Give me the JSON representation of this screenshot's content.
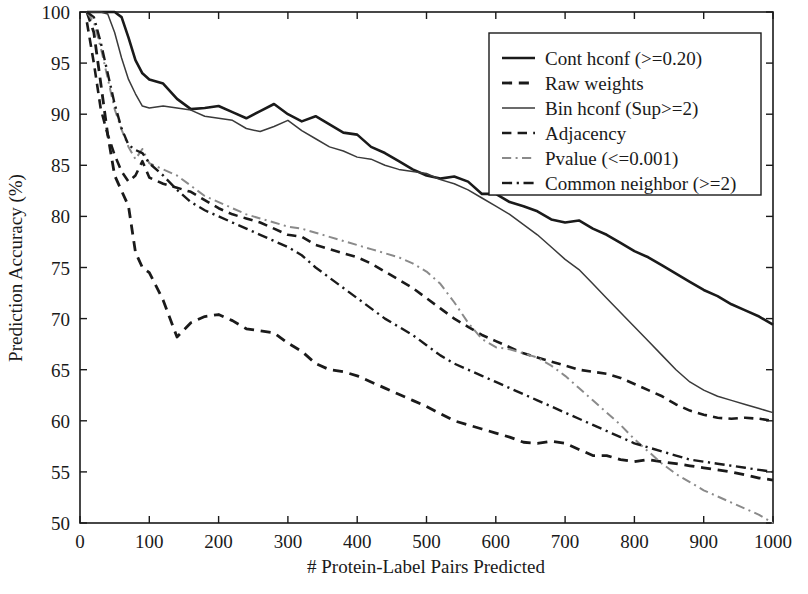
{
  "chart_data": {
    "type": "line",
    "title": "",
    "xlabel": "# Protein-Label Pairs Predicted",
    "ylabel": "Prediction Accuracy (%)",
    "xlim": [
      0,
      1000
    ],
    "ylim": [
      50,
      100
    ],
    "xticks": [
      0,
      100,
      200,
      300,
      400,
      500,
      600,
      700,
      800,
      900,
      1000
    ],
    "yticks": [
      50,
      55,
      60,
      65,
      70,
      75,
      80,
      85,
      90,
      95,
      100
    ],
    "grid": false,
    "legend_position": "top-right",
    "x": [
      10,
      20,
      30,
      40,
      50,
      60,
      70,
      80,
      90,
      100,
      120,
      140,
      160,
      180,
      200,
      220,
      240,
      260,
      280,
      300,
      320,
      340,
      360,
      380,
      400,
      420,
      440,
      460,
      480,
      500,
      520,
      540,
      560,
      580,
      600,
      620,
      640,
      660,
      680,
      700,
      720,
      740,
      760,
      780,
      800,
      820,
      840,
      860,
      880,
      900,
      920,
      940,
      960,
      980,
      1000
    ],
    "series": [
      {
        "name": "Cont hconf (>=0.20)",
        "style": "solid",
        "color": "#1a1a1a",
        "width": 2.6,
        "values": [
          100,
          100,
          100,
          100,
          100,
          99.5,
          97.5,
          95.3,
          94.0,
          93.4,
          93.0,
          91.5,
          90.5,
          90.6,
          90.8,
          90.2,
          89.6,
          90.3,
          91.0,
          90.0,
          89.3,
          89.8,
          89.0,
          88.2,
          88.0,
          86.8,
          86.2,
          85.4,
          84.6,
          84.0,
          83.7,
          83.9,
          83.4,
          82.2,
          82.2,
          81.4,
          81.0,
          80.5,
          79.7,
          79.4,
          79.6,
          78.8,
          78.2,
          77.4,
          76.6,
          76.0,
          75.2,
          74.4,
          73.6,
          72.8,
          72.2,
          71.4,
          70.8,
          70.2,
          69.4
        ]
      },
      {
        "name": "Raw weights",
        "style": "dashed",
        "color": "#1a1a1a",
        "width": 2.8,
        "values": [
          100,
          98.0,
          93.0,
          88.0,
          84.0,
          82.5,
          81.0,
          76.5,
          75.0,
          74.5,
          71.8,
          68.2,
          69.6,
          70.2,
          70.4,
          69.8,
          69.0,
          68.8,
          68.6,
          67.6,
          66.8,
          65.6,
          65.0,
          64.8,
          64.4,
          63.8,
          63.2,
          62.6,
          62.0,
          61.4,
          60.7,
          60.0,
          59.6,
          59.2,
          58.8,
          58.4,
          57.9,
          57.8,
          58.0,
          57.8,
          57.2,
          56.6,
          56.6,
          56.2,
          56.0,
          56.2,
          56.0,
          55.8,
          55.6,
          55.4,
          55.2,
          55.0,
          54.7,
          54.4,
          54.2
        ]
      },
      {
        "name": "Bin hconf (Sup>=2)",
        "style": "solid",
        "color": "#3a3a3a",
        "width": 1.5,
        "values": [
          100,
          100,
          100,
          99.8,
          98.0,
          95.5,
          93.4,
          92.0,
          90.8,
          90.6,
          90.8,
          90.6,
          90.4,
          89.8,
          89.6,
          89.4,
          88.6,
          88.3,
          88.8,
          89.4,
          88.4,
          87.6,
          86.8,
          86.4,
          85.8,
          85.6,
          85.0,
          84.6,
          84.4,
          84.2,
          83.6,
          83.2,
          82.6,
          81.8,
          81.0,
          80.2,
          79.2,
          78.2,
          77.0,
          75.8,
          74.8,
          73.4,
          72.0,
          70.6,
          69.2,
          67.8,
          66.4,
          65.0,
          63.8,
          63.0,
          62.4,
          62.0,
          61.6,
          61.2,
          60.8
        ]
      },
      {
        "name": "Adjacency",
        "style": "dashed",
        "color": "#1a1a1a",
        "width": 2.6,
        "values": [
          99.0,
          95.0,
          90.5,
          88.0,
          86.0,
          84.4,
          83.4,
          84.0,
          85.4,
          83.8,
          83.2,
          82.8,
          82.4,
          81.6,
          80.8,
          80.2,
          79.8,
          79.4,
          78.8,
          78.2,
          78.0,
          77.2,
          76.8,
          76.4,
          76.0,
          75.4,
          74.6,
          73.8,
          73.0,
          72.0,
          71.0,
          70.0,
          69.2,
          68.4,
          67.8,
          67.2,
          66.6,
          66.2,
          65.8,
          65.4,
          65.0,
          64.8,
          64.6,
          64.2,
          63.6,
          63.0,
          62.4,
          61.6,
          61.0,
          60.6,
          60.3,
          60.2,
          60.3,
          60.2,
          60.0
        ]
      },
      {
        "name": "Pvalue (<=0.001)",
        "style": "dashdot-light",
        "color": "#8a8a8a",
        "width": 2.0,
        "values": [
          100,
          99.0,
          96.5,
          93.5,
          90.5,
          88.5,
          86.8,
          85.6,
          86.6,
          85.2,
          84.6,
          84.0,
          83.0,
          82.0,
          81.4,
          80.8,
          80.2,
          79.8,
          79.4,
          79.0,
          78.8,
          78.4,
          78.0,
          77.6,
          77.2,
          76.8,
          76.4,
          76.0,
          75.4,
          74.6,
          73.4,
          71.6,
          69.6,
          68.0,
          67.2,
          67.0,
          66.6,
          66.2,
          65.4,
          64.4,
          63.2,
          62.0,
          60.8,
          59.6,
          58.2,
          57.0,
          55.8,
          54.8,
          54.0,
          53.2,
          52.6,
          52.0,
          51.4,
          50.8,
          50.0
        ]
      },
      {
        "name": "Common neighbor (>=2)",
        "style": "dashdot",
        "color": "#1a1a1a",
        "width": 2.4,
        "values": [
          100,
          99.5,
          97.0,
          94.0,
          91.0,
          88.6,
          87.0,
          86.5,
          86.2,
          85.2,
          84.0,
          82.6,
          81.4,
          80.6,
          80.0,
          79.4,
          78.8,
          78.2,
          77.6,
          77.0,
          76.2,
          75.0,
          74.0,
          73.0,
          72.0,
          71.0,
          70.0,
          69.2,
          68.4,
          67.4,
          66.4,
          65.6,
          65.0,
          64.4,
          63.8,
          63.2,
          62.6,
          62.0,
          61.4,
          60.8,
          60.2,
          59.6,
          59.0,
          58.4,
          57.8,
          57.4,
          57.0,
          56.6,
          56.2,
          56.0,
          55.8,
          55.6,
          55.4,
          55.2,
          55.0
        ]
      }
    ]
  },
  "legend": {
    "entries": [
      {
        "label": "Cont hconf (>=0.20)"
      },
      {
        "label": "Raw weights"
      },
      {
        "label": "Bin hconf (Sup>=2)"
      },
      {
        "label": "Adjacency"
      },
      {
        "label": "Pvalue (<=0.001)"
      },
      {
        "label": "Common neighbor (>=2)"
      }
    ]
  },
  "axes": {
    "x_title": "# Protein-Label Pairs Predicted",
    "y_title": "Prediction Accuracy (%)",
    "x_tick_labels": [
      "0",
      "100",
      "200",
      "300",
      "400",
      "500",
      "600",
      "700",
      "800",
      "900",
      "1000"
    ],
    "y_tick_labels": [
      "50",
      "55",
      "60",
      "65",
      "70",
      "75",
      "80",
      "85",
      "90",
      "95",
      "100"
    ]
  }
}
